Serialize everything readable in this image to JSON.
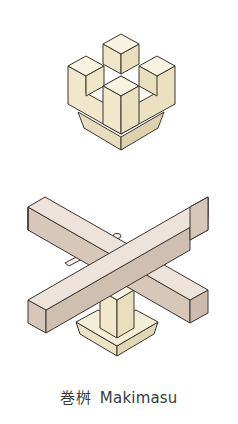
{
  "figure": {
    "caption": {
      "japanese": "巻桝",
      "romaji": "Makimasu"
    },
    "parts": [
      {
        "name": "makimasu-block",
        "description": "isometric view of the bearing block with cross-shaped slot"
      },
      {
        "name": "crossed-beams",
        "description": "two beams crossing over the block, assembled view"
      }
    ],
    "colors": {
      "block_top": "#f8f3e1",
      "block_left": "#efe6c8",
      "block_right": "#e9dfbd",
      "beam_top": "#ede3da",
      "beam_side": "#d7c7b8",
      "beam_dark": "#cdbcad",
      "outline": "#3b3530",
      "caption_text": "#3a3a3a"
    }
  }
}
